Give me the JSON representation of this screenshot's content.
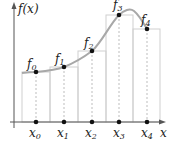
{
  "diagram": {
    "y_axis_label": "f(x)",
    "x_axis_label": "x",
    "colors": {
      "axis": "#555555",
      "curve": "#a8a8a8",
      "rect_stroke": "#cfcfcf",
      "dotted": "#bdbdbd",
      "point": "#111111",
      "text": "#222222"
    },
    "points": [
      {
        "x_label": "x",
        "x_sub": "0",
        "f_label": "f",
        "f_sub": "0"
      },
      {
        "x_label": "x",
        "x_sub": "1",
        "f_label": "f",
        "f_sub": "1"
      },
      {
        "x_label": "x",
        "x_sub": "2",
        "f_label": "f",
        "f_sub": "2"
      },
      {
        "x_label": "x",
        "x_sub": "3",
        "f_label": "f",
        "f_sub": "3"
      },
      {
        "x_label": "x",
        "x_sub": "4",
        "f_label": "f",
        "f_sub": "4"
      }
    ]
  }
}
